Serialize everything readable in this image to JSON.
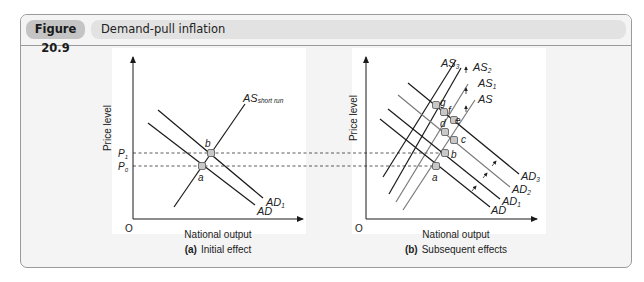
{
  "figure": {
    "number": "Figure 20.9",
    "title": "Demand-pull inflation"
  },
  "panels": [
    {
      "id": "a",
      "caption_prefix": "(a)",
      "caption": "Initial effect",
      "xlabel": "National output",
      "ylabel": "Price level",
      "origin": "O",
      "price_labels": [
        {
          "base": "P",
          "sub": "1"
        },
        {
          "base": "P",
          "sub": "0"
        }
      ],
      "curves": [
        {
          "name": "AS",
          "sub": "short run"
        },
        {
          "name": "AD",
          "sub": "1"
        },
        {
          "name": "AD",
          "sub": ""
        }
      ],
      "points": [
        "a",
        "b"
      ]
    },
    {
      "id": "b",
      "caption_prefix": "(b)",
      "caption": "Subsequent effects",
      "xlabel": "National output",
      "ylabel": "Price level",
      "origin": "O",
      "curves": [
        {
          "name": "AS",
          "sub": "3"
        },
        {
          "name": "AS",
          "sub": "2"
        },
        {
          "name": "AS",
          "sub": "1"
        },
        {
          "name": "AS",
          "sub": ""
        },
        {
          "name": "AD",
          "sub": "3"
        },
        {
          "name": "AD",
          "sub": "2"
        },
        {
          "name": "AD",
          "sub": "1"
        },
        {
          "name": "AD",
          "sub": ""
        }
      ],
      "points": [
        "a",
        "b",
        "c",
        "d",
        "e",
        "f",
        "g"
      ]
    }
  ],
  "colors": {
    "frame_bg": "#f4f4f4",
    "plot_bg": "#ffffff",
    "line_dark": "#1a1a1a",
    "line_grey": "#7a7a7a",
    "badge_bg": "#c4c4c4",
    "title_bg": "#e2e2e2",
    "point_fill": "#c8c8c8"
  }
}
